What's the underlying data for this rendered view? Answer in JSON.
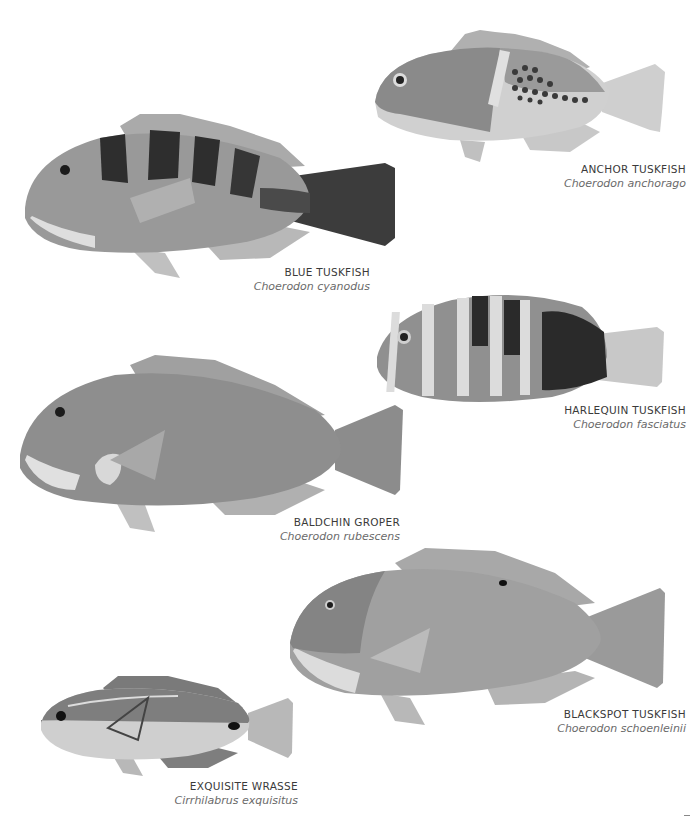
{
  "plate": {
    "background": "#ffffff",
    "species": [
      {
        "id": "anchor",
        "common_name": "ANCHOR TUSKFISH",
        "scientific_name": "Choerodon anchorago",
        "body_color": "#8a8a8a",
        "belly_color": "#d4d4d4"
      },
      {
        "id": "blue",
        "common_name": "BLUE TUSKFISH",
        "scientific_name": "Choerodon cyanodus",
        "body_color": "#8c8c8c",
        "belly_color": "#d8d8d8"
      },
      {
        "id": "harlequin",
        "common_name": "HARLEQUIN TUSKFISH",
        "scientific_name": "Choerodon fasciatus",
        "body_color": "#7d7d7d",
        "belly_color": "#cfcfcf"
      },
      {
        "id": "baldchin",
        "common_name": "BALDCHIN GROPER",
        "scientific_name": "Choerodon rubescens",
        "body_color": "#8e8e8e",
        "belly_color": "#dcdcdc"
      },
      {
        "id": "blackspot",
        "common_name": "BLACKSPOT TUSKFISH",
        "scientific_name": "Choerodon schoenleinii",
        "body_color": "#999999",
        "belly_color": "#d6d6d6"
      },
      {
        "id": "exquisite",
        "common_name": "EXQUISITE WRASSE",
        "scientific_name": "Cirrhilabrus exquisitus",
        "body_color": "#8a8a8a",
        "belly_color": "#d0d0d0"
      }
    ]
  }
}
